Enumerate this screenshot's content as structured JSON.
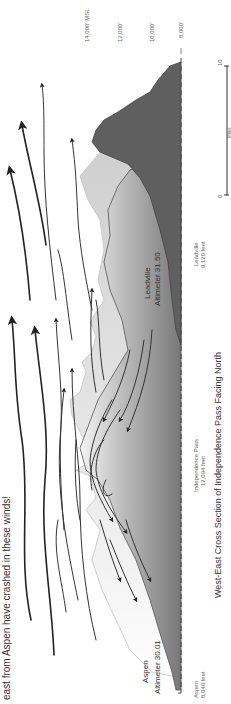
{
  "caption": {
    "top_text": "east from Aspen have crashed in these winds!"
  },
  "title": "West-East Cross Section of Independence Pass Facing North",
  "altitude_scale": {
    "labels": [
      "14,000' MSL",
      "12,000'",
      "10,000'",
      "8,000'"
    ]
  },
  "distance_scale": {
    "start": "0",
    "end": "10",
    "unit": "Miles"
  },
  "locations": {
    "aspen": {
      "name": "Aspen",
      "elevation": "8,049  feet"
    },
    "pass": {
      "name": "Independence Pass",
      "elevation": "12,094 feet"
    },
    "leadville": {
      "name": "Leadville",
      "elevation": "9,120  feet"
    }
  },
  "altimeter_labels": {
    "aspen": {
      "line1": "Aspen",
      "line2": "Altimeter 30.01"
    },
    "leadville": {
      "line1": "Leadville",
      "line2": "Altimeter 31.50"
    }
  },
  "colors": {
    "terrain_dark": "#5f5f5f",
    "terrain_light": "#d8d8d8",
    "terrain_gradient_end": "#ffffff",
    "arrows": "#222222",
    "text": "#666666"
  }
}
